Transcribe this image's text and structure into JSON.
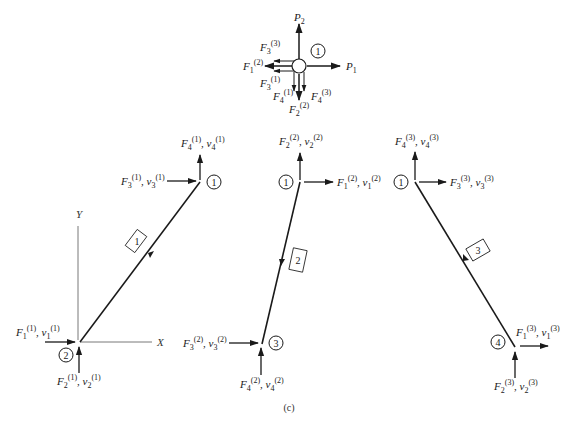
{
  "figure": {
    "caption": "(c)",
    "node_fbd": {
      "node_label": "1",
      "labels": {
        "P2": {
          "base": "P",
          "sub": "2"
        },
        "P1": {
          "base": "P",
          "sub": "1"
        },
        "F3_3": {
          "base": "F",
          "sub": "3",
          "sup": "(3)"
        },
        "F1_2": {
          "base": "F",
          "sub": "1",
          "sup": "(2)"
        },
        "F3_1": {
          "base": "F",
          "sub": "3",
          "sup": "(1)"
        },
        "F4_1": {
          "base": "F",
          "sub": "4",
          "sup": "(1)"
        },
        "F2_2": {
          "base": "F",
          "sub": "2",
          "sup": "(2)"
        },
        "F4_3": {
          "base": "F",
          "sub": "4",
          "sup": "(3)"
        }
      }
    },
    "axes": {
      "x_label": "X",
      "y_label": "Y"
    },
    "elements": [
      {
        "element_label": "1",
        "start_node": "2",
        "end_node": "1",
        "forces": {
          "top_up": "F4(1), v4(1)",
          "top_right": "F3(1), v3(1)",
          "bottom_left": "F1(1), v1(1)",
          "bottom_up": "F2(1), v2(1)"
        }
      },
      {
        "element_label": "2",
        "start_node": "1",
        "end_node": "3",
        "forces": {
          "top_up": "F2(2), v2(2)",
          "top_right": "F1(2), v1(2)",
          "bottom_left": "F3(2), v3(2)",
          "bottom_up": "F4(2), v4(2)"
        }
      },
      {
        "element_label": "3",
        "start_node": "4",
        "end_node": "1",
        "forces": {
          "top_up": "F4(3), v4(3)",
          "top_right": "F3(3), v3(3)",
          "bottom_right": "F1(3), v1(3)",
          "bottom_up": "F2(3), v2(3)"
        }
      }
    ],
    "text": {
      "e1_n_top": "1",
      "e1_n_bot": "2",
      "e1_box": "1",
      "e2_n_top": "1",
      "e2_n_bot": "3",
      "e2_box": "2",
      "e3_n_top": "1",
      "e3_n_bot": "4",
      "e3_box": "3",
      "fbd_node": "1",
      "x_axis": "X",
      "y_axis": "Y",
      "F": "F",
      "v": "v",
      "P": "P",
      "s1": "1",
      "s2": "2",
      "s3": "3",
      "s4": "4",
      "u1": "(1)",
      "u2": "(2)",
      "u3": "(3)",
      "comma": ", "
    }
  }
}
